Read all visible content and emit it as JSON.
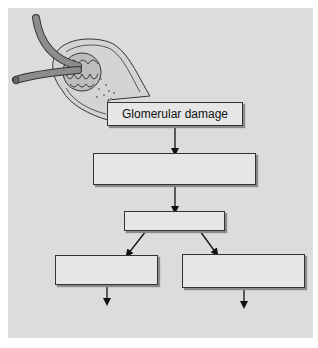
{
  "diagram": {
    "illustration": "glomerulus-with-afferent-efferent-arterioles-and-bowman-capsule",
    "colors": {
      "panel": "#dcdcdc",
      "box_fill": "#e6e6e6",
      "border": "#333333",
      "vessel": "#8c8c8c"
    },
    "boxes": [
      {
        "id": "glomerular-damage",
        "label": "Glomerular damage"
      },
      {
        "id": "step-2",
        "label": ""
      },
      {
        "id": "step-3",
        "label": ""
      },
      {
        "id": "branch-left",
        "label": ""
      },
      {
        "id": "branch-right",
        "label": ""
      }
    ]
  }
}
